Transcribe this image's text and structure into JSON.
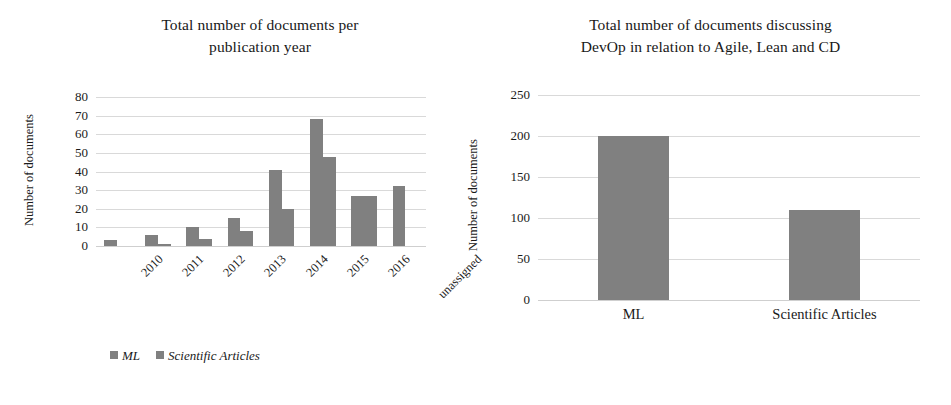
{
  "figure": {
    "background": "#ffffff",
    "bar_color": "#808080",
    "gridline_color": "#d9d9d9"
  },
  "charts": [
    {
      "id": "documents-per-publication-year",
      "title": "Total number of documents per publication year",
      "title_lines": [
        "Total number of documents per",
        "publication year"
      ],
      "ylabel": "Number of documents"
    },
    {
      "id": "documents-devops-agile-lean-cd",
      "title": "Total number of documents discussing DevOp in relation to Agile, Lean and CD",
      "title_lines": [
        "Total number of documents discussing",
        "DevOp in relation to Agile, Lean and CD"
      ],
      "ylabel": "Number of documents"
    }
  ],
  "chart_data": [
    {
      "type": "bar",
      "id": "documents-per-publication-year",
      "title": "Total number of documents per publication year",
      "xlabel": "",
      "ylabel": "Number of documents",
      "ylim": [
        0,
        80
      ],
      "yticks": [
        0,
        10,
        20,
        30,
        40,
        50,
        60,
        70,
        80
      ],
      "grid": true,
      "legend_position": "bottom",
      "categories": [
        "2010",
        "2011",
        "2012",
        "2013",
        "2014",
        "2015",
        "2016",
        "unassigned"
      ],
      "series": [
        {
          "name": "ML",
          "values": [
            3,
            6,
            10,
            15,
            41,
            68,
            27,
            32
          ]
        },
        {
          "name": "Scientific Articles",
          "values": [
            0,
            1,
            4,
            8,
            20,
            48,
            27,
            0
          ]
        }
      ]
    },
    {
      "type": "bar",
      "id": "documents-devops-agile-lean-cd",
      "title": "Total number of documents discussing DevOp in relation to Agile, Lean and CD",
      "xlabel": "",
      "ylabel": "Number of documents",
      "ylim": [
        0,
        250
      ],
      "yticks": [
        0,
        50,
        100,
        150,
        200,
        250
      ],
      "grid": true,
      "legend_position": "bottom",
      "categories": [
        "ML",
        "Scientific Articles"
      ],
      "series": [
        {
          "name": "Documents discussing DevOps in relation to Agile, lean and CD",
          "values": [
            200,
            110
          ]
        }
      ]
    }
  ]
}
